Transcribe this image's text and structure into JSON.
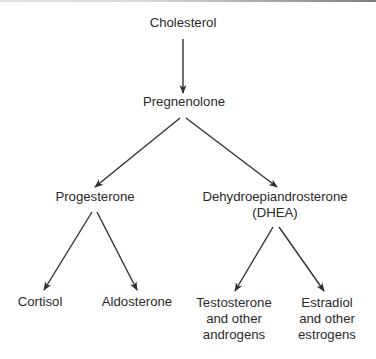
{
  "diagram": {
    "type": "flowchart-tree",
    "colors": {
      "text": "#2a2a2a",
      "arrow": "#333333",
      "background": "#ffffff"
    },
    "nodes": {
      "cholesterol": {
        "lines": [
          "Cholesterol"
        ]
      },
      "pregnenolone": {
        "lines": [
          "Pregnenolone"
        ]
      },
      "progesterone": {
        "lines": [
          "Progesterone"
        ]
      },
      "dhea": {
        "lines": [
          "Dehydroepiandrosterone",
          "(DHEA)"
        ]
      },
      "cortisol": {
        "lines": [
          "Cortisol"
        ]
      },
      "aldosterone": {
        "lines": [
          "Aldosterone"
        ]
      },
      "testosterone": {
        "lines": [
          "Testosterone",
          "and other",
          "androgens"
        ]
      },
      "estradiol": {
        "lines": [
          "Estradiol",
          "and other",
          "estrogens"
        ]
      }
    },
    "edges": [
      {
        "from": "cholesterol",
        "to": "pregnenolone"
      },
      {
        "from": "pregnenolone",
        "to": "progesterone"
      },
      {
        "from": "pregnenolone",
        "to": "dhea"
      },
      {
        "from": "progesterone",
        "to": "cortisol"
      },
      {
        "from": "progesterone",
        "to": "aldosterone"
      },
      {
        "from": "dhea",
        "to": "testosterone"
      },
      {
        "from": "dhea",
        "to": "estradiol"
      }
    ]
  }
}
